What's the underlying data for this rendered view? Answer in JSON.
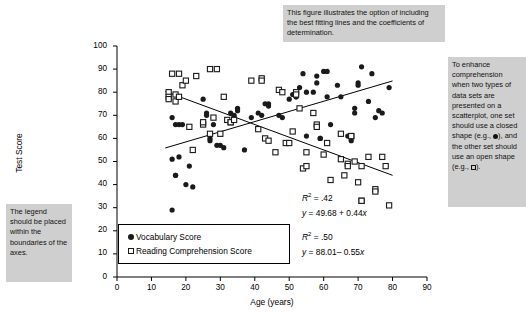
{
  "figure": {
    "callouts": [
      {
        "id": "top",
        "text": "This figure illustrates the option of including the best fitting lines and the coefficients of determination."
      },
      {
        "id": "right",
        "text_before_dot": "To enhance comprehension when two types of data sets are presented on a scatterplot, one set should use a closed shape (e.g.,",
        "text_middle": "), and the other set should use an open shape (e.g.,",
        "text_after": ")."
      },
      {
        "id": "left",
        "text": "The legend should be placed within the boundaries of the axes."
      }
    ],
    "annotations": [
      {
        "r2": "R² = .42",
        "equation": "y = 49.68 + 0.44x"
      },
      {
        "r2": "R² = .50",
        "equation": "y = 88.01– 0.55x"
      }
    ],
    "colors": {
      "callout_background": "#cfcfcf",
      "marker_closed": "#1a1a1a",
      "marker_open_stroke": "#1a1a1a",
      "axis": "#000000",
      "trend_line": "#000000",
      "plot_background": "#ffffff"
    }
  },
  "chart_data": {
    "type": "scatter",
    "title": "",
    "xlabel": "Age (years)",
    "ylabel": "Test Score",
    "xlim": [
      0,
      90
    ],
    "ylim": [
      0,
      100
    ],
    "xticks": [
      0,
      10,
      20,
      30,
      40,
      50,
      60,
      70,
      80,
      90
    ],
    "yticks": [
      0,
      10,
      20,
      30,
      40,
      50,
      60,
      70,
      80,
      90,
      100
    ],
    "grid": false,
    "legend_position": "inside-bottom-left",
    "legend": [
      "Vocabulary Score",
      "Reading Comprehension Score"
    ],
    "series": [
      {
        "name": "Vocabulary Score",
        "marker": "closed-circle",
        "points": [
          [
            16,
            69
          ],
          [
            16,
            51
          ],
          [
            16,
            29
          ],
          [
            17,
            66
          ],
          [
            17,
            44
          ],
          [
            17,
            44
          ],
          [
            18,
            66
          ],
          [
            18,
            52
          ],
          [
            19,
            66
          ],
          [
            20,
            40
          ],
          [
            21,
            48
          ],
          [
            22,
            39
          ],
          [
            25,
            77
          ],
          [
            26,
            71
          ],
          [
            26,
            70
          ],
          [
            27,
            60
          ],
          [
            27,
            59
          ],
          [
            28,
            66
          ],
          [
            29,
            57
          ],
          [
            30,
            57
          ],
          [
            31,
            56
          ],
          [
            33,
            71
          ],
          [
            34,
            70
          ],
          [
            34,
            69
          ],
          [
            35,
            73
          ],
          [
            35,
            72
          ],
          [
            37,
            55
          ],
          [
            39,
            69
          ],
          [
            41,
            71
          ],
          [
            42,
            70
          ],
          [
            43,
            75
          ],
          [
            44,
            75
          ],
          [
            44,
            74
          ],
          [
            47,
            70
          ],
          [
            48,
            69
          ],
          [
            50,
            77
          ],
          [
            51,
            79
          ],
          [
            52,
            78
          ],
          [
            52,
            78
          ],
          [
            53,
            82
          ],
          [
            54,
            88
          ],
          [
            55,
            80
          ],
          [
            55,
            61
          ],
          [
            57,
            80
          ],
          [
            58,
            84
          ],
          [
            58,
            87
          ],
          [
            59,
            60
          ],
          [
            59,
            60
          ],
          [
            60,
            89
          ],
          [
            61,
            89
          ],
          [
            61,
            78
          ],
          [
            62,
            66
          ],
          [
            64,
            83
          ],
          [
            65,
            78
          ],
          [
            65,
            62
          ],
          [
            67,
            61
          ],
          [
            68,
            59
          ],
          [
            69,
            73
          ],
          [
            69,
            71
          ],
          [
            70,
            84
          ],
          [
            70,
            83
          ],
          [
            71,
            91
          ],
          [
            73,
            76
          ],
          [
            74,
            88
          ],
          [
            75,
            69
          ],
          [
            76,
            72
          ],
          [
            77,
            71
          ],
          [
            79,
            82
          ]
        ]
      },
      {
        "name": "Reading Comprehension Score",
        "marker": "open-square",
        "points": [
          [
            15,
            80
          ],
          [
            15,
            78
          ],
          [
            15,
            77
          ],
          [
            16,
            88
          ],
          [
            17,
            79
          ],
          [
            17,
            76
          ],
          [
            18,
            88
          ],
          [
            18,
            78
          ],
          [
            19,
            83
          ],
          [
            20,
            85
          ],
          [
            21,
            65
          ],
          [
            22,
            55
          ],
          [
            23,
            87
          ],
          [
            25,
            66
          ],
          [
            25,
            67
          ],
          [
            27,
            90
          ],
          [
            27,
            62
          ],
          [
            28,
            69
          ],
          [
            29,
            90
          ],
          [
            30,
            62
          ],
          [
            31,
            78
          ],
          [
            32,
            68
          ],
          [
            33,
            67
          ],
          [
            33,
            67
          ],
          [
            34,
            68
          ],
          [
            39,
            85
          ],
          [
            41,
            64
          ],
          [
            42,
            86
          ],
          [
            42,
            85
          ],
          [
            43,
            60
          ],
          [
            44,
            59
          ],
          [
            46,
            54
          ],
          [
            47,
            81
          ],
          [
            48,
            80
          ],
          [
            49,
            58
          ],
          [
            50,
            58
          ],
          [
            51,
            63
          ],
          [
            52,
            80
          ],
          [
            52,
            79
          ],
          [
            53,
            73
          ],
          [
            54,
            47
          ],
          [
            55,
            48
          ],
          [
            55,
            54
          ],
          [
            57,
            71
          ],
          [
            58,
            66
          ],
          [
            58,
            65
          ],
          [
            60,
            53
          ],
          [
            61,
            58
          ],
          [
            62,
            42
          ],
          [
            65,
            62
          ],
          [
            65,
            51
          ],
          [
            66,
            44
          ],
          [
            67,
            49
          ],
          [
            67,
            48
          ],
          [
            68,
            61
          ],
          [
            68,
            61
          ],
          [
            69,
            50
          ],
          [
            70,
            41
          ],
          [
            71,
            48
          ],
          [
            71,
            33
          ],
          [
            71,
            33
          ],
          [
            73,
            52
          ],
          [
            75,
            38
          ],
          [
            75,
            37
          ],
          [
            77,
            52
          ],
          [
            78,
            48
          ],
          [
            79,
            31
          ]
        ]
      }
    ],
    "trend_lines": [
      {
        "name": "Vocabulary Score best fit",
        "r_squared": 0.42,
        "intercept": 49.68,
        "slope": 0.44,
        "x_from": 14,
        "x_to": 80
      },
      {
        "name": "Reading Comprehension Score best fit",
        "r_squared": 0.5,
        "intercept": 88.01,
        "slope": -0.55,
        "x_from": 14,
        "x_to": 80
      }
    ]
  }
}
